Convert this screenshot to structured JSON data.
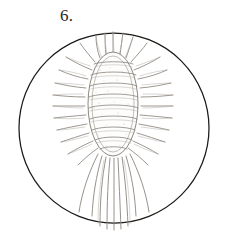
{
  "plate": {
    "figure_label": "6.",
    "caption": "",
    "background_color": "#ffffff"
  },
  "field_of_view": {
    "name": "microscope-field-circle",
    "shape": "circle",
    "center_x": 114,
    "center_y": 128,
    "radius": 95,
    "stroke_color": "#1c1a18",
    "stroke_width": 1.25
  },
  "organism": {
    "name": "ciliate-specimen",
    "body": {
      "shape": "elongated-oval",
      "center_x": 113,
      "center_y": 104,
      "radius_x": 25,
      "radius_y": 52,
      "outline_color": "#8d8880",
      "fill_color": "#fdfdfc"
    },
    "transverse_bands": {
      "count": 9,
      "color": "#8f8981",
      "y_positions": [
        64,
        74,
        85,
        96,
        107,
        118,
        129,
        139,
        148
      ]
    },
    "marginal_cirri": {
      "count": 26,
      "color": "#918b83",
      "description": "radiating spine-like cirri encircling the body"
    },
    "caudal_cirri": {
      "count": 9,
      "color": "#8b857d",
      "description": "long trailing filaments extending from posterior end",
      "extends_to_y": 230
    },
    "stipple": {
      "color": "#bdb7af",
      "description": "fine granular shading across body interior"
    }
  }
}
